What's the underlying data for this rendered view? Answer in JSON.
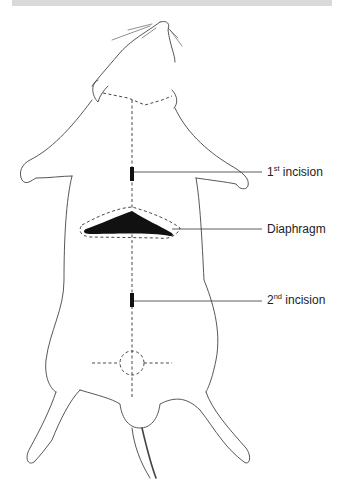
{
  "figure": {
    "labels": [
      {
        "main": "1",
        "sup": "st",
        "rest": " incision"
      },
      {
        "main": "Diaphragm",
        "sup": "",
        "rest": ""
      },
      {
        "main": "2",
        "sup": "nd",
        "rest": " incision"
      }
    ],
    "colors": {
      "line": "#333333",
      "fill": "#111111",
      "header_bar": "#d9d9d9"
    }
  }
}
